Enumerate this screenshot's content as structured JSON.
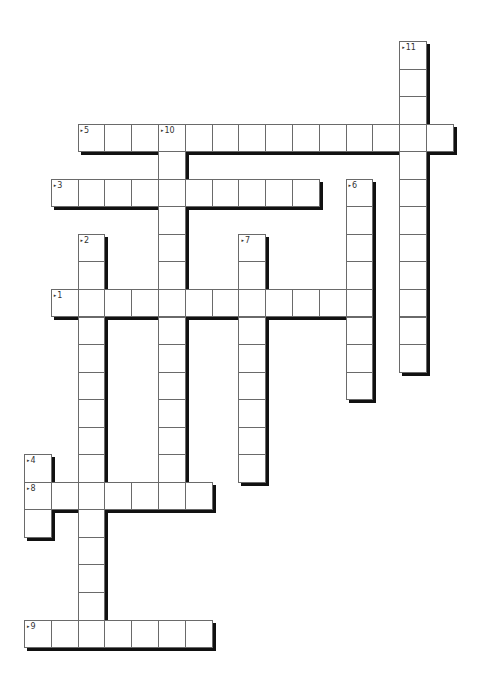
{
  "puzzle": {
    "type": "crossword",
    "cell_width": 26.8,
    "cell_height": 27.55,
    "origin_x": 24,
    "origin_y": 41,
    "entries": [
      {
        "number": "1",
        "direction": "across",
        "row": 9,
        "col": 1,
        "length": 12
      },
      {
        "number": "2",
        "direction": "down",
        "row": 7,
        "col": 2,
        "length": 15
      },
      {
        "number": "3",
        "direction": "across",
        "row": 5,
        "col": 1,
        "length": 10
      },
      {
        "number": "4",
        "direction": "down",
        "row": 15,
        "col": 0,
        "length": 3
      },
      {
        "number": "5",
        "direction": "across",
        "row": 3,
        "col": 2,
        "length": 14
      },
      {
        "number": "6",
        "direction": "down",
        "row": 5,
        "col": 12,
        "length": 8
      },
      {
        "number": "7",
        "direction": "down",
        "row": 7,
        "col": 8,
        "length": 9
      },
      {
        "number": "8",
        "direction": "across",
        "row": 16,
        "col": 0,
        "length": 7
      },
      {
        "number": "9",
        "direction": "across",
        "row": 21,
        "col": 0,
        "length": 7
      },
      {
        "number": "10",
        "direction": "down",
        "row": 3,
        "col": 5,
        "length": 14
      },
      {
        "number": "11",
        "direction": "down",
        "row": 0,
        "col": 14,
        "length": 12
      }
    ]
  }
}
